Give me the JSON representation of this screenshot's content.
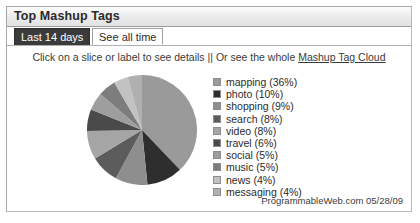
{
  "panel": {
    "title": "Top Mashup Tags"
  },
  "tabs": [
    {
      "label": "Last 14 days",
      "state": "unselected"
    },
    {
      "label": "See all time",
      "state": "selected"
    }
  ],
  "hint": {
    "text_before": "Click on a slice or label to see details || Or see the whole ",
    "link_label": "Mashup Tag Cloud"
  },
  "footer": {
    "attribution": "ProgrammableWeb.com  05/28/09"
  },
  "chart_data": {
    "type": "pie",
    "title": "Top Mashup Tags",
    "legend_position": "right",
    "start_angle_deg": 0,
    "direction": "clockwise",
    "categories": [
      "mapping",
      "photo",
      "shopping",
      "search",
      "video",
      "travel",
      "social",
      "music",
      "news",
      "messaging"
    ],
    "values": [
      36,
      10,
      9,
      8,
      8,
      6,
      5,
      5,
      4,
      4
    ],
    "unit": "%",
    "labels": [
      "mapping (36%)",
      "photo (10%)",
      "shopping (9%)",
      "search (8%)",
      "video (8%)",
      "travel (6%)",
      "social (5%)",
      "music (5%)",
      "news (4%)",
      "messaging (4%)"
    ],
    "colors": [
      "#9a9a9a",
      "#2e2e2e",
      "#8e8e8e",
      "#5c5c5c",
      "#a5a5a5",
      "#4a4a4a",
      "#9e9e9e",
      "#7d7d7d",
      "#c2c2c2",
      "#b0b0b0"
    ]
  },
  "colors": {
    "panel_border": "#a8a8a8",
    "tab_selected_bg": "#ffffff",
    "tab_unselected_bg": "#3b3b3b",
    "text": "#2b2b2b"
  }
}
